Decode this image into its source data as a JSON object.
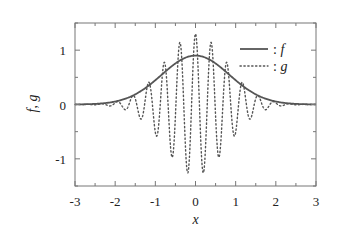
{
  "chart_data": {
    "type": "line",
    "title": "",
    "xlabel": "x",
    "ylabel": "f, g",
    "xlim": [
      -3,
      3
    ],
    "ylim": [
      -1.5,
      1.5
    ],
    "grid": false,
    "legend_position": "top-right",
    "x_ticks": [
      -3,
      -2,
      -1,
      0,
      1,
      2,
      3
    ],
    "x_tick_labels": [
      "-3",
      "-2",
      "-1",
      "0",
      "1",
      "2",
      "3"
    ],
    "y_ticks": [
      -1,
      0,
      1
    ],
    "y_tick_labels": [
      "-1",
      "0",
      "1"
    ],
    "series": [
      {
        "name": "f",
        "legend_label": ": f",
        "style": "solid",
        "color": "#555555",
        "x": [
          -3,
          -2.75,
          -2.5,
          -2.25,
          -2,
          -1.75,
          -1.5,
          -1.25,
          -1,
          -0.75,
          -0.5,
          -0.25,
          0,
          0.25,
          0.5,
          0.75,
          1,
          1.25,
          1.5,
          1.75,
          2,
          2.25,
          2.5,
          2.75,
          3
        ],
        "y": [
          0.002,
          0.005,
          0.011,
          0.026,
          0.055,
          0.105,
          0.19,
          0.3,
          0.45,
          0.61,
          0.76,
          0.86,
          0.9,
          0.86,
          0.76,
          0.61,
          0.45,
          0.3,
          0.19,
          0.105,
          0.055,
          0.026,
          0.011,
          0.005,
          0.002
        ]
      },
      {
        "name": "g",
        "legend_label": ": g",
        "style": "dotted",
        "color": "#555555",
        "amplitude": 1.3,
        "period": 0.39,
        "x": [
          -3,
          -2.8,
          -2.6,
          -2.4,
          -2.2,
          -2.0,
          -1.8,
          -1.6,
          -1.4,
          -1.2,
          -1.0,
          -0.8,
          -0.6,
          -0.4,
          -0.2,
          0,
          0.2,
          0.4,
          0.6,
          0.8,
          1.0,
          1.2,
          1.4,
          1.6,
          1.8,
          2.0,
          2.2,
          2.4,
          2.6,
          2.8,
          3.0
        ],
        "y": [
          0.0,
          0.0,
          0.01,
          0.0,
          -0.02,
          0.05,
          -0.05,
          0.12,
          -0.18,
          0.28,
          -0.4,
          0.72,
          -0.8,
          1.0,
          -1.2,
          1.25,
          -1.2,
          1.0,
          -0.8,
          0.72,
          -0.4,
          0.28,
          -0.18,
          0.12,
          -0.05,
          0.05,
          -0.02,
          0.0,
          0.01,
          0.0,
          0.0
        ]
      }
    ]
  }
}
